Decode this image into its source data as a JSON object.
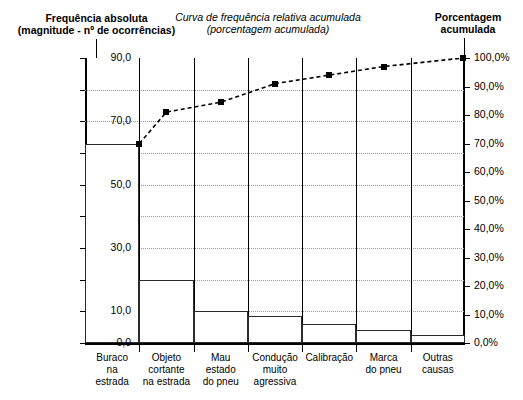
{
  "headers": {
    "left": "Frequência absoluta\n(magnitude - nº de ocorrências)",
    "left_line1": "Frequência absoluta",
    "left_line2": "(magnitude - nº de ocorrências)",
    "middle_line1": "Curva de frequência relativa acumulada",
    "middle_line2": "(porcentagem acumulada)",
    "right_line1": "Porcentagem",
    "right_line2": "acumulada"
  },
  "chart_data": {
    "type": "bar",
    "title": "Frequência absoluta (magnitude - nº de ocorrências)",
    "subtitle": "Curva de frequência relativa acumulada (porcentagem acumulada)",
    "xlabel": "",
    "ylabel": "Frequência absoluta",
    "y2label": "Porcentagem acumulada",
    "ylim": [
      0,
      90
    ],
    "y2lim": [
      0,
      100
    ],
    "grid": true,
    "legend": "none",
    "categories": [
      "Buraco na estrada",
      "Objeto cortante na estrada",
      "Mau estado do pneu",
      "Condução muito agressiva",
      "Calibração",
      "Marca do pneu",
      "Outras causas"
    ],
    "category_lines": [
      [
        "Buraco",
        "na",
        "estrada"
      ],
      [
        "Objeto",
        "cortante",
        "na estrada"
      ],
      [
        "Mau",
        "estado",
        "do pneu"
      ],
      [
        "Condução",
        "muito",
        "agressiva"
      ],
      [
        "Calibração"
      ],
      [
        "Marca",
        "do pneu"
      ],
      [
        "Outras",
        "causas"
      ]
    ],
    "values": [
      63,
      20,
      10,
      8.5,
      6,
      4,
      2.5
    ],
    "series": [
      {
        "name": "Frequência absoluta",
        "type": "bar",
        "values": [
          63,
          20,
          10,
          8.5,
          6,
          4,
          2.5
        ]
      },
      {
        "name": "Curva de frequência relativa acumulada",
        "type": "line",
        "values": [
          74.0,
          81.0,
          84.5,
          91.0,
          94.0,
          97.0,
          100.0
        ]
      }
    ],
    "y_ticks": [
      0,
      10,
      20,
      30,
      40,
      50,
      60,
      70,
      80,
      90
    ],
    "y_tick_labels": [
      "0,0",
      "10,0",
      "20,0",
      "30,0",
      "40,0",
      "50,0",
      "60,0",
      "70,0",
      "80,0",
      "90,0"
    ],
    "y_tick_labels_shown": [
      "0,0",
      "10,0",
      "30,0",
      "50,0",
      "70,0",
      "90,0"
    ],
    "y2_ticks": [
      0,
      10,
      20,
      30,
      40,
      50,
      60,
      70,
      80,
      90,
      100
    ],
    "y2_tick_labels": [
      "0,0%",
      "10,0%",
      "20,0%",
      "30,0%",
      "40,0%",
      "50,0%",
      "60,0%",
      "70,0%",
      "80,0%",
      "90,0%",
      "100,0%"
    ]
  },
  "colors": {
    "bar_stroke": "#2b2b2b",
    "bar_fill": "#ffffff",
    "axis": "#000000",
    "grid": "#9a9a9a",
    "curve": "#000000"
  }
}
